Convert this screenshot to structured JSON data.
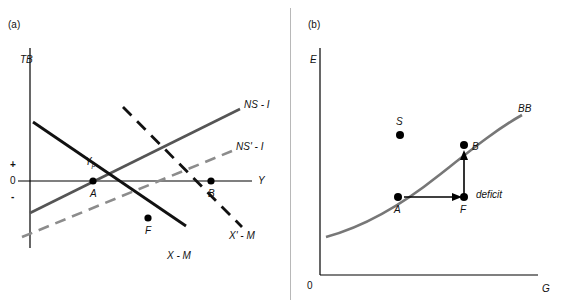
{
  "figure": {
    "panel_a": {
      "tag": "(a)",
      "y_axis_label": "TB",
      "x_axis_label": "Y",
      "axis_marks": {
        "plus": "+",
        "zero": "0",
        "minus": "-"
      },
      "curve_labels": {
        "ns_i": "NS - I",
        "ns_prime_i": "NS' - I",
        "x_m": "X - M",
        "x_prime_m": "X' - M"
      },
      "points": {
        "yp": "Y",
        "yp_sub": "p",
        "a": "A",
        "b": "B",
        "f": "F"
      }
    },
    "panel_b": {
      "tag": "(b)",
      "y_axis_label": "E",
      "x_axis_label": "G",
      "origin_label": "0",
      "curve_label": "BB",
      "points": {
        "s": "S",
        "a": "A",
        "b": "B",
        "f": "F"
      },
      "annotations": {
        "deficit": "deficit"
      }
    }
  },
  "colors": {
    "axis": "#000000",
    "solid_curve": "#555555",
    "dark_line": "#111111",
    "dashed_gray": "#8c8c8c",
    "point": "#000000",
    "divider": "#b8b8b8"
  }
}
